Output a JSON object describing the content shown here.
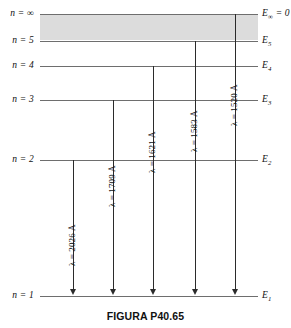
{
  "caption": "FIGURA P40.65",
  "diagram": {
    "type": "energy-level-diagram",
    "title": "FIGURA P40.65",
    "continuum": {
      "label": "continuum-band",
      "top_level": "n = ∞",
      "bottom_level": "n = 5"
    },
    "levels": [
      {
        "id": "inf",
        "n_label": "n = ∞",
        "e_label": "E",
        "e_sub": "∞",
        "e_suffix": " = 0",
        "y": 14
      },
      {
        "id": "5",
        "n_label": "n = 5",
        "e_label": "E",
        "e_sub": "5",
        "e_suffix": "",
        "y": 41
      },
      {
        "id": "4",
        "n_label": "n = 4",
        "e_label": "E",
        "e_sub": "4",
        "e_suffix": "",
        "y": 66
      },
      {
        "id": "3",
        "n_label": "n = 3",
        "e_label": "E",
        "e_sub": "3",
        "e_suffix": "",
        "y": 100
      },
      {
        "id": "2",
        "n_label": "n = 2",
        "e_label": "E",
        "e_sub": "2",
        "e_suffix": "",
        "y": 160
      },
      {
        "id": "1",
        "n_label": "n = 1",
        "e_label": "E",
        "e_sub": "1",
        "e_suffix": "",
        "y": 296
      }
    ],
    "transitions": [
      {
        "id": "t1",
        "from": "n = 2",
        "to": "n = 1",
        "wavelength_label": "λ = 2026 Å",
        "wavelength": 2026,
        "unit": "Å",
        "x": 73,
        "y_top": 160,
        "y_bottom": 296
      },
      {
        "id": "t2",
        "from": "n = 3",
        "to": "n = 1",
        "wavelength_label": "λ = 1709 Å",
        "wavelength": 1709,
        "unit": "Å",
        "x": 113,
        "y_top": 100,
        "y_bottom": 296
      },
      {
        "id": "t3",
        "from": "n = 4",
        "to": "n = 1",
        "wavelength_label": "λ = 1621 Å",
        "wavelength": 1621,
        "unit": "Å",
        "x": 153,
        "y_top": 66,
        "y_bottom": 296
      },
      {
        "id": "t4",
        "from": "n = 5",
        "to": "n = 1",
        "wavelength_label": "λ = 1583 Å",
        "wavelength": 1583,
        "unit": "Å",
        "x": 195,
        "y_top": 41,
        "y_bottom": 296
      },
      {
        "id": "t5",
        "from": "n = ∞",
        "to": "n = 1",
        "wavelength_label": "λ = 1520 Å",
        "wavelength": 1520,
        "unit": "Å",
        "x": 235,
        "y_top": 14,
        "y_bottom": 296
      }
    ],
    "colors": {
      "band": "#dcdcdc",
      "level_line": "#6e6e6e",
      "arrow": "#2b2b2b",
      "text": "#111111",
      "background": "#ffffff"
    }
  }
}
